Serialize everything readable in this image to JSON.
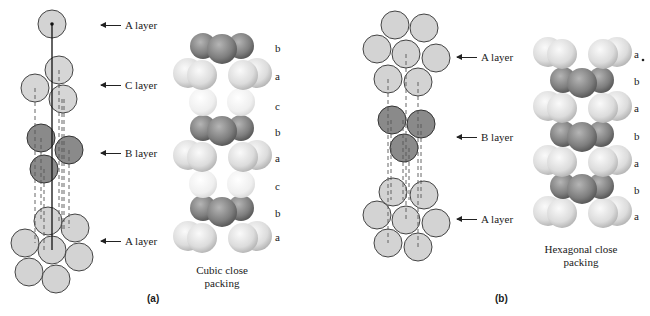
{
  "figure": {
    "panel_a": {
      "label": "(a)",
      "layer_labels": [
        "A layer",
        "C layer",
        "B layer",
        "A layer"
      ],
      "stack_letters": [
        "b",
        "a",
        "c",
        "b",
        "a",
        "c",
        "b",
        "a"
      ],
      "caption_line1": "Cubic close",
      "caption_line2": "packing"
    },
    "panel_b": {
      "label": "(b)",
      "layer_labels": [
        "A layer",
        "B layer",
        "A layer"
      ],
      "stack_letters": [
        "a",
        "b",
        "a",
        "b",
        "a",
        "b",
        "a"
      ],
      "caption_line1": "Hexagonal close",
      "caption_line2": "packing"
    },
    "colors": {
      "light_sphere": "#d6d6d6",
      "dark_sphere": "#7a7a7a",
      "pale_sphere": "#ececec",
      "outline": "#333333"
    }
  }
}
